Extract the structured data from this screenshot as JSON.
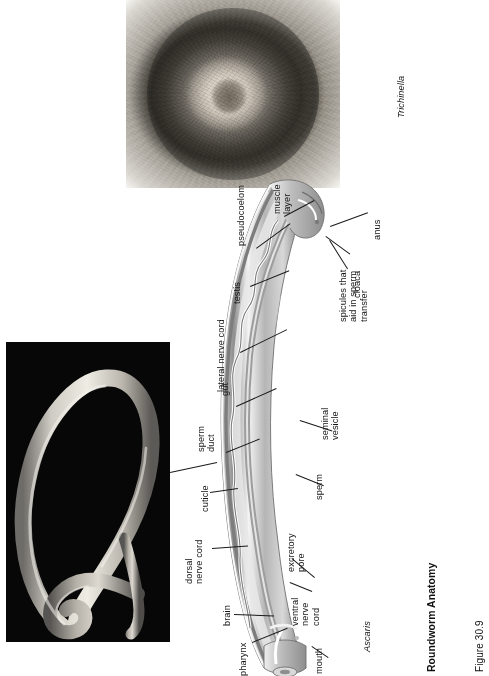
{
  "figure": {
    "caption_title": "Roundworm Anatomy",
    "caption_number": "Figure 30.9"
  },
  "photos": {
    "trichinella": {
      "species_label": "Trichinella",
      "description": "light micrograph of an encysted Trichinella larva coiled within concentric host cyst rings"
    },
    "ascaris": {
      "species_label": "Ascaris",
      "description": "photograph of a pale Ascaris roundworm coiled in a figure-eight against a black background"
    }
  },
  "diagram": {
    "labels": [
      {
        "id": "pseudocoelom",
        "text": "pseudocoelom"
      },
      {
        "id": "muscle-layer",
        "text": "muscle\nlayer"
      },
      {
        "id": "anus",
        "text": "anus"
      },
      {
        "id": "cloaca",
        "text": "cloaca"
      },
      {
        "id": "spicules",
        "text": "spicules that\naid in sperm\ntransfer"
      },
      {
        "id": "testis",
        "text": "testis"
      },
      {
        "id": "lateral-nerve-cord",
        "text": "lateral nerve cord"
      },
      {
        "id": "gut",
        "text": "gut"
      },
      {
        "id": "seminal-vesicle",
        "text": "seminal\nvesicle"
      },
      {
        "id": "sperm-duct",
        "text": "sperm\nduct"
      },
      {
        "id": "sperm",
        "text": "sperm"
      },
      {
        "id": "cuticle",
        "text": "cuticle"
      },
      {
        "id": "dorsal-nerve-cord",
        "text": "dorsal\nnerve cord"
      },
      {
        "id": "excretory-pore",
        "text": "excretory\npore"
      },
      {
        "id": "ventral-nerve-cord",
        "text": "ventral\nnerve\ncord"
      },
      {
        "id": "brain",
        "text": "brain"
      },
      {
        "id": "pharynx",
        "text": "pharynx"
      },
      {
        "id": "mouth",
        "text": "mouth"
      }
    ]
  },
  "colors": {
    "page_background": "#ffffff",
    "text": "#161616",
    "leader_line": "#1a1a1a",
    "photo_background": "#070707",
    "diagram_mid_gray": "#9a9a9a",
    "diagram_dark_gray": "#6a6a6a"
  }
}
